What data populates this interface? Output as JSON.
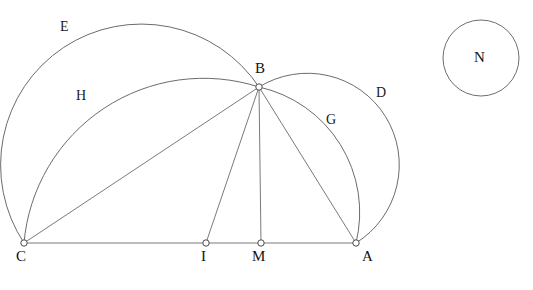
{
  "figure": {
    "background_color": "#ffffff",
    "stroke_color": "#5a5a5a",
    "label_color": "#111111",
    "width": 533,
    "height": 290
  },
  "points": [
    {
      "id": "C",
      "label": "C",
      "x": 24,
      "y": 243,
      "label_x": 16,
      "label_y": 249
    },
    {
      "id": "I",
      "label": "I",
      "x": 206,
      "y": 243,
      "label_x": 201,
      "label_y": 249
    },
    {
      "id": "M",
      "label": "M",
      "x": 261,
      "y": 243,
      "label_x": 252,
      "label_y": 249
    },
    {
      "id": "A",
      "label": "A",
      "x": 356,
      "y": 243,
      "label_x": 362,
      "label_y": 249
    },
    {
      "id": "B",
      "label": "B",
      "x": 259,
      "y": 87,
      "label_x": 255,
      "label_y": 61
    }
  ],
  "arc_labels": [
    {
      "id": "E",
      "label": "E",
      "label_x": 60,
      "label_y": 20
    },
    {
      "id": "H",
      "label": "H",
      "label_x": 76,
      "label_y": 89
    },
    {
      "id": "D",
      "label": "D",
      "label_x": 376,
      "label_y": 86
    },
    {
      "id": "G",
      "label": "G",
      "label_x": 326,
      "label_y": 113
    }
  ],
  "free_circle": {
    "id": "N",
    "label": "N",
    "cx": 481,
    "cy": 58,
    "r": 38,
    "label_x": 474,
    "label_y": 50
  },
  "segments": [
    {
      "id": "CA",
      "from": "C",
      "to": "A",
      "d": "M 24 243 L 356 243"
    },
    {
      "id": "CB",
      "from": "C",
      "to": "B",
      "d": "M 24 243 L 259 87"
    },
    {
      "id": "BI",
      "from": "B",
      "to": "I",
      "d": "M 259 87 L 206 243"
    },
    {
      "id": "BM",
      "from": "B",
      "to": "M",
      "d": "M 259 87 L 261 243"
    },
    {
      "id": "BA",
      "from": "B",
      "to": "A",
      "d": "M 259 87 L 356 243"
    }
  ],
  "arcs": [
    {
      "id": "E",
      "from": "C",
      "to": "B",
      "d": "M 24 243 A 122 122 0 0 1 259 87",
      "note": "large outer arc from C over to B"
    },
    {
      "id": "H",
      "from": "C",
      "to": "B",
      "d": "M 24 243 A 180 180 0 0 1 259 87",
      "note": "inner arc from C to B"
    },
    {
      "id": "D",
      "from": "B",
      "to": "A",
      "d": "M 259 87 A 82 82 0 0 1 356 243",
      "note": "outer semicircle arc from B around right to A"
    },
    {
      "id": "G",
      "from": "B",
      "to": "A",
      "d": "M 259 87 A 128 128 0 0 1 356 243",
      "note": "inner arc from B to A"
    }
  ]
}
